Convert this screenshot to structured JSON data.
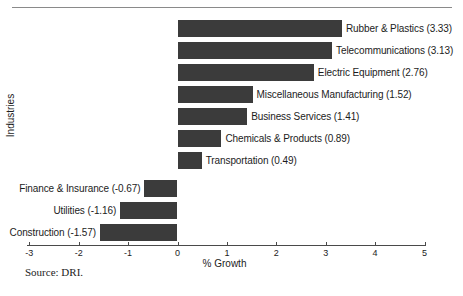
{
  "figure": {
    "source_note": "Source:  DRI.",
    "axis_label_x": "% Growth",
    "axis_label_y": "Industries"
  },
  "chart_data": {
    "type": "bar",
    "orientation": "horizontal",
    "title": "",
    "xlabel": "% Growth",
    "ylabel": "Industries",
    "xlim": [
      -3,
      5
    ],
    "xticks": [
      -3,
      -2,
      -1,
      0,
      1,
      2,
      3,
      4,
      5
    ],
    "xticklabels": [
      "-3",
      "-2",
      "-1",
      "0",
      "1",
      "2",
      "3",
      "4",
      "5"
    ],
    "grid": false,
    "legend": false,
    "bar_color": "#3b3b3b",
    "categories": [
      "Rubber & Plastics",
      "Telecommunications",
      "Electric Equipment",
      "Miscellaneous Manufacturing",
      "Business Services",
      "Chemicals & Products",
      "Transportation",
      "Finance & Insurance",
      "Utilities",
      "Construction"
    ],
    "values": [
      3.33,
      3.13,
      2.76,
      1.52,
      1.41,
      0.89,
      0.49,
      -0.67,
      -1.16,
      -1.57
    ],
    "bar_labels": [
      "Rubber & Plastics (3.33)",
      "Telecommunications (3.13)",
      "Electric Equipment (2.76)",
      "Miscellaneous Manufacturing (1.52)",
      "Business Services (1.41)",
      "Chemicals & Products (0.89)",
      "Transportation (0.49)",
      "Finance & Insurance (-0.67)",
      "Utilities (-1.16)",
      "Construction (-1.57)"
    ]
  }
}
